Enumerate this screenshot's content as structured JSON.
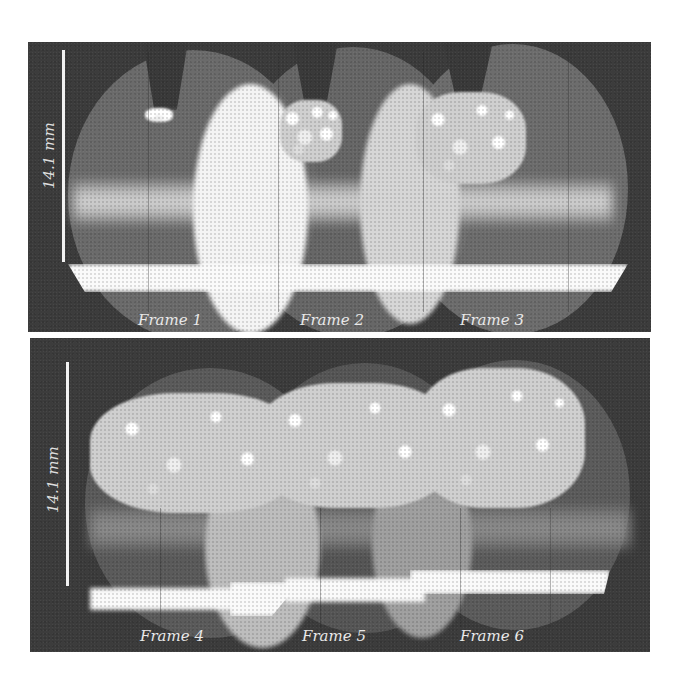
{
  "figure": {
    "panels": [
      {
        "id": "top",
        "scale_bar": {
          "label": "14.1 mm"
        },
        "frames": [
          {
            "label": "Frame 1"
          },
          {
            "label": "Frame 2"
          },
          {
            "label": "Frame 3"
          }
        ]
      },
      {
        "id": "bottom",
        "scale_bar": {
          "label": "14.1 mm"
        },
        "frames": [
          {
            "label": "Frame 4"
          },
          {
            "label": "Frame 5"
          },
          {
            "label": "Frame 6"
          }
        ]
      }
    ],
    "colors": {
      "page_background": "#ffffff",
      "panel_background": "#3c3c3c",
      "annotation_text": "#e8e8e8"
    }
  }
}
